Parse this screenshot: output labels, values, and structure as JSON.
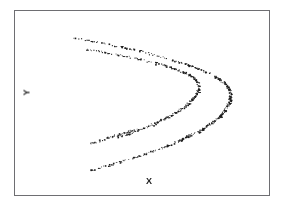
{
  "figure": {
    "name": "scatter-plot-figure",
    "background_color": "#ffffff",
    "frame_color": "#6e6e72",
    "point_color": "#1c1c1c"
  },
  "axes": {
    "x_label": "X",
    "y_label": "Y",
    "x_label_name": "x-axis-label",
    "y_label_name": "y-axis-label",
    "show_ticks": false,
    "show_gridlines": false,
    "frame": {
      "left": 14,
      "top": 10,
      "width": 256,
      "height": 186
    }
  },
  "chart_data": {
    "type": "scatter",
    "title": "",
    "subtitle": "",
    "xlabel": "X",
    "ylabel": "Y",
    "xlim": [
      0,
      1
    ],
    "ylim": [
      0,
      1
    ],
    "grid": false,
    "legend": null,
    "tick_labels": {
      "x": [],
      "y": []
    },
    "annotations": [],
    "series": [
      {
        "name": "outer-arc",
        "marker": "point",
        "color": "#1c1c1c",
        "point_size": 1,
        "density": 420,
        "curve": {
          "form": "sideways-parabola",
          "vertex": [
            0.845,
            0.545
          ],
          "opening": "left",
          "upper_endpoint": [
            0.225,
            0.855
          ],
          "lower_endpoint": [
            0.3,
            0.14
          ],
          "width_coefficient": 2.2,
          "jitter": 0.012
        }
      },
      {
        "name": "inner-arc",
        "marker": "point",
        "color": "#1c1c1c",
        "point_size": 1,
        "density": 330,
        "curve": {
          "form": "sideways-parabola",
          "vertex": [
            0.72,
            0.595
          ],
          "opening": "left",
          "upper_endpoint": [
            0.285,
            0.79
          ],
          "lower_endpoint": [
            0.405,
            0.32
          ],
          "width_coefficient": 3.4,
          "jitter": 0.013
        }
      },
      {
        "name": "inner-arc-lower-tail",
        "marker": "point",
        "color": "#1c1c1c",
        "point_size": 1,
        "density": 90,
        "curve": {
          "form": "segment",
          "start": [
            0.3,
            0.285
          ],
          "end": [
            0.47,
            0.36
          ],
          "jitter": 0.01
        }
      }
    ]
  }
}
